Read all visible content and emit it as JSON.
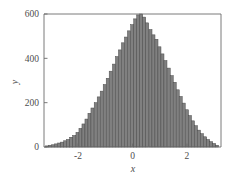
{
  "chart_data": {
    "type": "bar",
    "subtype": "histogram",
    "title": "",
    "subtitle": "",
    "xlabel": "x",
    "ylabel": "y",
    "xlim": [
      -3.25,
      3.25
    ],
    "ylim": [
      0,
      600
    ],
    "xticks": [
      -2,
      0,
      2
    ],
    "xticklabels": [
      "-2",
      "0",
      "2"
    ],
    "yticks": [
      0,
      200,
      400,
      600
    ],
    "yticklabels": [
      "0",
      "200",
      "400",
      "600"
    ],
    "grid": false,
    "legend": null,
    "legend_position": "none",
    "bar_color": "#808080",
    "bar_edge_color": "#4a4a4a",
    "axis_color": "#6b6b6b",
    "background_color": "#ffffff",
    "bin_width": 0.112,
    "bin_centers": [
      -3.14,
      -3.03,
      -2.92,
      -2.81,
      -2.69,
      -2.58,
      -2.47,
      -2.36,
      -2.25,
      -2.14,
      -2.02,
      -1.91,
      -1.8,
      -1.69,
      -1.58,
      -1.47,
      -1.35,
      -1.24,
      -1.13,
      -1.02,
      -0.91,
      -0.8,
      -0.68,
      -0.57,
      -0.46,
      -0.35,
      -0.24,
      -0.13,
      -0.01,
      0.1,
      0.21,
      0.32,
      0.43,
      0.54,
      0.66,
      0.77,
      0.88,
      0.99,
      1.1,
      1.21,
      1.33,
      1.44,
      1.55,
      1.66,
      1.77,
      1.88,
      2.0,
      2.11,
      2.22,
      2.33,
      2.44,
      2.55,
      2.67,
      2.78,
      2.89,
      3.0,
      3.11
    ],
    "values": [
      5,
      8,
      10,
      14,
      18,
      22,
      28,
      34,
      44,
      52,
      66,
      84,
      104,
      126,
      152,
      176,
      200,
      226,
      252,
      282,
      310,
      342,
      374,
      408,
      438,
      470,
      496,
      524,
      552,
      578,
      596,
      600,
      586,
      560,
      530,
      506,
      486,
      452,
      420,
      390,
      356,
      322,
      292,
      258,
      228,
      198,
      168,
      142,
      118,
      96,
      76,
      60,
      46,
      34,
      24,
      16,
      8
    ],
    "n_bins": 57
  }
}
